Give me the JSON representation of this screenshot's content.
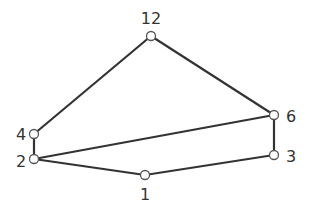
{
  "diagram": {
    "type": "hasse",
    "nodes": [
      {
        "id": "12",
        "label": "12",
        "x": 151,
        "y": 36,
        "lx": 151,
        "ly": 24,
        "anchor": "middle"
      },
      {
        "id": "4",
        "label": "4",
        "x": 34,
        "y": 134,
        "lx": 21,
        "ly": 140,
        "anchor": "middle"
      },
      {
        "id": "2",
        "label": "2",
        "x": 34,
        "y": 159,
        "lx": 21,
        "ly": 167,
        "anchor": "middle"
      },
      {
        "id": "6",
        "label": "6",
        "x": 274,
        "y": 115,
        "lx": 291,
        "ly": 122,
        "anchor": "middle"
      },
      {
        "id": "3",
        "label": "3",
        "x": 274,
        "y": 155,
        "lx": 291,
        "ly": 162,
        "anchor": "middle"
      },
      {
        "id": "1",
        "label": "1",
        "x": 145,
        "y": 175,
        "lx": 145,
        "ly": 200,
        "anchor": "middle"
      }
    ],
    "edges": [
      [
        "12",
        "4"
      ],
      [
        "12",
        "6"
      ],
      [
        "4",
        "2"
      ],
      [
        "2",
        "6"
      ],
      [
        "2",
        "1"
      ],
      [
        "1",
        "3"
      ],
      [
        "3",
        "6"
      ]
    ],
    "colors": {
      "edge": "#333333",
      "node_stroke": "#555555",
      "node_fill": "#ffffff",
      "label": "#333333"
    }
  }
}
